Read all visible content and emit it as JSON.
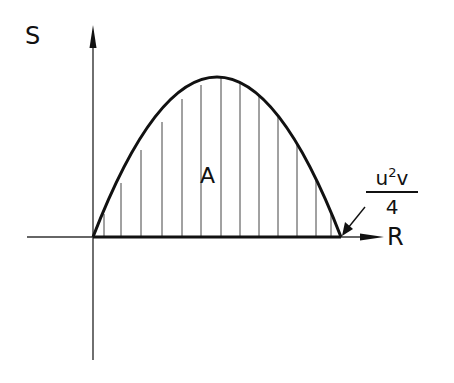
{
  "diagram": {
    "y_axis_label": "S",
    "x_axis_label": "R",
    "area_label": "A",
    "endpoint_label": {
      "numerator_base": "u",
      "numerator_exp": "2",
      "numerator_tail": "v",
      "denominator": "4"
    },
    "colors": {
      "ink": "#111111",
      "background": "#ffffff"
    },
    "curve": {
      "type": "parabola",
      "start_x": 93,
      "end_x": 341,
      "baseline_y": 237,
      "peak_y": 77
    },
    "hatch_count": 13
  }
}
